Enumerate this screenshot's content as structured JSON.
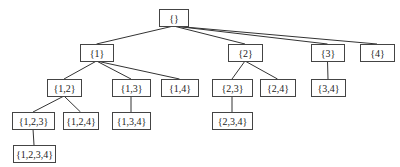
{
  "diagram": {
    "type": "tree",
    "title": "",
    "nodes": [
      {
        "id": "root",
        "label": "{}",
        "x": 159,
        "y": 9,
        "w": 29,
        "h": 17
      },
      {
        "id": "n1",
        "label": "{1}",
        "x": 80,
        "y": 44,
        "w": 33,
        "h": 17
      },
      {
        "id": "n2",
        "label": "{2}",
        "x": 228,
        "y": 44,
        "w": 34,
        "h": 17
      },
      {
        "id": "n3",
        "label": "{3}",
        "x": 311,
        "y": 44,
        "w": 33,
        "h": 17
      },
      {
        "id": "n4",
        "label": "{4}",
        "x": 360,
        "y": 44,
        "w": 34,
        "h": 17
      },
      {
        "id": "n12",
        "label": "{1,2}",
        "x": 47,
        "y": 79,
        "w": 34,
        "h": 17
      },
      {
        "id": "n13",
        "label": "{1,3}",
        "x": 112,
        "y": 79,
        "w": 38,
        "h": 17
      },
      {
        "id": "n14",
        "label": "{1,4}",
        "x": 161,
        "y": 79,
        "w": 37,
        "h": 17
      },
      {
        "id": "n23",
        "label": "{2,3}",
        "x": 212,
        "y": 79,
        "w": 40,
        "h": 17
      },
      {
        "id": "n24",
        "label": "{2,4}",
        "x": 260,
        "y": 79,
        "w": 35,
        "h": 17
      },
      {
        "id": "n34",
        "label": "{3,4}",
        "x": 311,
        "y": 79,
        "w": 34,
        "h": 17
      },
      {
        "id": "n123",
        "label": "{1,2,3}",
        "x": 12,
        "y": 112,
        "w": 42,
        "h": 17
      },
      {
        "id": "n124",
        "label": "{1,2,4}",
        "x": 63,
        "y": 112,
        "w": 35,
        "h": 17
      },
      {
        "id": "n134",
        "label": "{1,3,4}",
        "x": 112,
        "y": 112,
        "w": 38,
        "h": 17
      },
      {
        "id": "n234",
        "label": "{2,3,4}",
        "x": 212,
        "y": 112,
        "w": 40,
        "h": 17
      },
      {
        "id": "n1234",
        "label": "{1,2,3,4}",
        "x": 13,
        "y": 145,
        "w": 42,
        "h": 17
      }
    ],
    "edges": [
      [
        "root",
        "n1"
      ],
      [
        "root",
        "n2"
      ],
      [
        "root",
        "n3"
      ],
      [
        "root",
        "n4"
      ],
      [
        "n1",
        "n12"
      ],
      [
        "n1",
        "n13"
      ],
      [
        "n1",
        "n14"
      ],
      [
        "n2",
        "n23"
      ],
      [
        "n2",
        "n24"
      ],
      [
        "n3",
        "n34"
      ],
      [
        "n12",
        "n123"
      ],
      [
        "n12",
        "n124"
      ],
      [
        "n13",
        "n134"
      ],
      [
        "n23",
        "n234"
      ],
      [
        "n123",
        "n1234"
      ]
    ]
  }
}
